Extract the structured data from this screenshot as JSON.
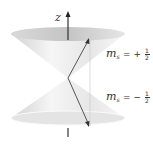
{
  "diagram": {
    "axis_label": "z",
    "upper_state": {
      "symbol": "m",
      "subscript": "s",
      "sign": "= +",
      "num": "1",
      "den": "2"
    },
    "lower_state": {
      "symbol": "m",
      "subscript": "s",
      "sign": "= −",
      "num": "1",
      "den": "2"
    },
    "colors": {
      "cone_light": "#f2f2f2",
      "cone_dark": "#bdbdbd",
      "arrow": "#555555",
      "axis": "#333333"
    }
  }
}
